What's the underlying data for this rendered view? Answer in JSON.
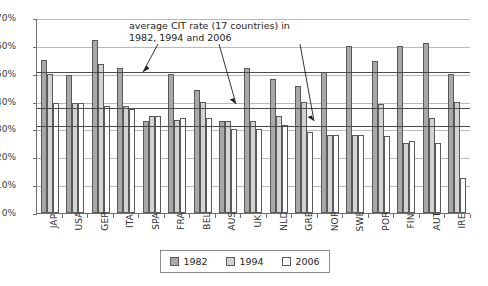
{
  "title_sliver": "",
  "annotation": {
    "line1": "average CIT rate (17 countries) in",
    "line2": "1982, 1994 and 2006"
  },
  "axes": {
    "y_ticks": [
      "0%",
      "10%",
      "20%",
      "30%",
      "40%",
      "50%",
      "60%",
      "70%"
    ]
  },
  "legend": {
    "items": [
      {
        "label": "1982",
        "color": "#a8a8a8"
      },
      {
        "label": "1994",
        "color": "#d3d3d3"
      },
      {
        "label": "2006",
        "color": "#fdfdfd"
      }
    ]
  },
  "chart_data": {
    "type": "bar",
    "title": "",
    "xlabel": "",
    "ylabel": "",
    "ylim": [
      0,
      70
    ],
    "ytick_step": 10,
    "grid": true,
    "legend_position": "bottom",
    "categories": [
      "JAP",
      "USA",
      "GER",
      "ITA",
      "SPA",
      "FRA",
      "BEL",
      "AUS",
      "UK",
      "NLD",
      "GRE",
      "NOR",
      "SWE",
      "POR",
      "FIN",
      "AUT",
      "IRE"
    ],
    "series": [
      {
        "name": "1982",
        "color": "#a8a8a8",
        "values": [
          55.0,
          49.5,
          62.0,
          52.0,
          33.0,
          50.0,
          44.3,
          33.0,
          52.0,
          48.0,
          45.5,
          50.8,
          60.0,
          54.5,
          60.0,
          61.0,
          50.0
        ]
      },
      {
        "name": "1994",
        "color": "#d3d3d3",
        "values": [
          50.0,
          39.5,
          53.5,
          38.5,
          35.0,
          33.3,
          39.8,
          33.0,
          33.0,
          35.0,
          40.0,
          28.0,
          28.0,
          39.0,
          25.0,
          34.0,
          40.0
        ]
      },
      {
        "name": "2006",
        "color": "#fdfdfd",
        "values": [
          39.5,
          39.5,
          38.5,
          37.5,
          35.0,
          34.0,
          34.0,
          30.0,
          30.0,
          31.5,
          29.0,
          28.0,
          28.0,
          27.5,
          26.0,
          25.0,
          12.5
        ]
      }
    ],
    "average_lines": [
      {
        "name": "average 1982",
        "value": 50.9
      },
      {
        "name": "average 1994",
        "value": 37.9
      },
      {
        "name": "average 2006",
        "value": 31.7
      }
    ]
  }
}
